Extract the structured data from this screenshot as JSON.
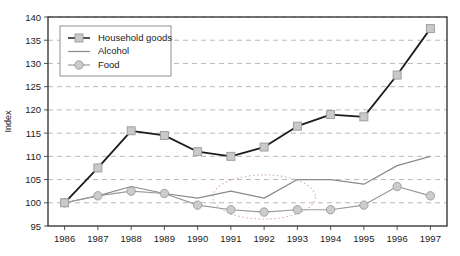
{
  "chart_data": {
    "type": "line",
    "title": "",
    "xlabel": "",
    "ylabel": "Index",
    "ylim": [
      95,
      140
    ],
    "ytick_step": 5,
    "grid": true,
    "grid_style": "dashed-horizontal",
    "legend_position": "top-left-inside",
    "categories": [
      "1986",
      "1987",
      "1988",
      "1989",
      "1990",
      "1991",
      "1992",
      "1993",
      "1994",
      "1995",
      "1996",
      "1997"
    ],
    "yticks": [
      "95",
      "100",
      "105",
      "110",
      "115",
      "120",
      "125",
      "130",
      "135",
      "140"
    ],
    "series": [
      {
        "name": "Household goods",
        "marker": "square",
        "color": "#1c1c1c",
        "marker_fill": "#c9c9c9",
        "values": [
          100,
          107.5,
          115.5,
          114.5,
          111,
          110,
          112,
          116.5,
          119,
          118.5,
          127.5,
          137.5
        ]
      },
      {
        "name": "Alcohol",
        "marker": "none",
        "color": "#8a8a8a",
        "marker_fill": "none",
        "values": [
          100,
          101.5,
          103.5,
          102,
          101,
          102.5,
          101,
          105,
          105,
          104,
          108,
          110
        ]
      },
      {
        "name": "Food",
        "marker": "circle",
        "color": "#9a9a9a",
        "marker_fill": "#cccccc",
        "values": [
          100,
          101.5,
          102.5,
          102,
          99.5,
          98.5,
          98,
          98.5,
          98.5,
          99.5,
          103.5,
          101.5
        ]
      }
    ],
    "annotations": [
      {
        "type": "ellipse",
        "style": "dotted",
        "color": "#d8a9a9",
        "x_center_category": "1992",
        "y_center": 101,
        "x_span_categories": [
          "1991",
          "1993"
        ],
        "y_span": [
          96.5,
          106
        ]
      }
    ]
  },
  "legend": {
    "items": [
      {
        "label": "Household goods"
      },
      {
        "label": "Alcohol"
      },
      {
        "label": "Food"
      }
    ]
  }
}
